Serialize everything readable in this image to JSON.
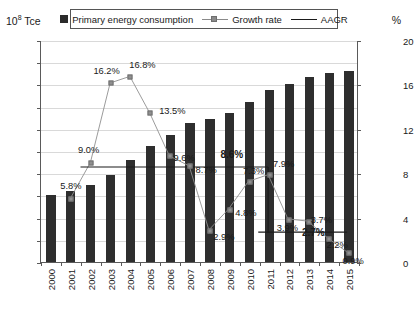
{
  "axes": {
    "left_unit": "10⁸ Tce",
    "left_unit_base": "10",
    "left_unit_exp": "8",
    "left_unit_suffix": " Tce",
    "right_unit": "%",
    "left_ticks": [
      "0.0",
      "5.0",
      "10.0",
      "15.0",
      "20.0",
      "25.0",
      "30.0",
      "35.0",
      "40.0",
      "45.0",
      "50.0"
    ],
    "right_ticks": [
      "0",
      "4",
      "8",
      "12",
      "16",
      "20"
    ],
    "left_min": 0,
    "left_max": 50,
    "right_min": 0,
    "right_max": 20
  },
  "legend": {
    "items": [
      {
        "label": "Primary energy consumption",
        "marker": "bar-swatch",
        "color": "#2b2b2b"
      },
      {
        "label": "Growth rate",
        "marker": "line-square-marker",
        "color": "#8f8f8f"
      },
      {
        "label": "AAGR",
        "marker": "plain-line",
        "color": "#1a1a1a"
      }
    ]
  },
  "chart_data": {
    "type": "bar",
    "title": "",
    "subtitle": "",
    "xlabel": "",
    "ylabel": "10⁸ Tce",
    "y2label": "%",
    "ylim": [
      0,
      50
    ],
    "y2lim": [
      0,
      20
    ],
    "grid": true,
    "legend_position": "top-center",
    "categories": [
      "2000",
      "2001",
      "2002",
      "2003",
      "2004",
      "2005",
      "2006",
      "2007",
      "2008",
      "2009",
      "2010",
      "2011",
      "2012",
      "2013",
      "2014",
      "2015"
    ],
    "series": [
      {
        "name": "Primary energy consumption",
        "type": "bar",
        "axis": "left",
        "color": "#2e2e2e",
        "values": [
          15.0,
          15.9,
          17.3,
          19.7,
          23.0,
          26.1,
          28.6,
          31.3,
          32.2,
          33.6,
          36.1,
          38.7,
          40.2,
          41.7,
          42.6,
          43.0
        ]
      },
      {
        "name": "Growth rate",
        "type": "line",
        "axis": "right",
        "color": "#8f8f8f",
        "values": [
          null,
          5.8,
          9.0,
          16.2,
          16.8,
          13.5,
          9.6,
          8.7,
          2.9,
          4.8,
          7.3,
          7.9,
          3.9,
          3.7,
          2.2,
          0.9
        ],
        "labels": [
          "",
          "5.8%",
          "9.0%",
          "16.2%",
          "16.8%",
          "13.5%",
          "9.6%",
          "8.7%",
          "2.9%",
          "4.8%",
          "7.3%",
          "7.9%",
          "3.9%",
          "3.7%",
          "2.2%",
          "0.9%"
        ]
      },
      {
        "name": "AAGR",
        "type": "step-line",
        "axis": "right",
        "color": "#1a1a1a",
        "segments": [
          {
            "from": "2002",
            "to": "2011",
            "value": 8.6,
            "label": "8.6%"
          },
          {
            "from": "2011",
            "to": "2015",
            "value": 2.7,
            "label": "2.7%"
          }
        ]
      }
    ],
    "annotations": [
      {
        "text": "8.6%",
        "bold": true,
        "near": "2009"
      },
      {
        "text": "2.7%",
        "bold": true,
        "near": "2013"
      }
    ]
  }
}
